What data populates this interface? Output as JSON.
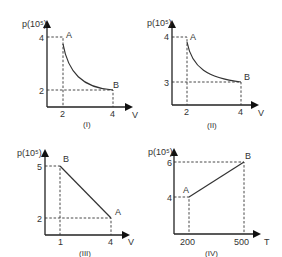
{
  "graphs": [
    {
      "id": "I",
      "caption": "(I)",
      "ylabel": "p(10⁵)",
      "xlabel": "V",
      "y_ticks": [
        "4",
        "2"
      ],
      "x_ticks": [
        "2",
        "4"
      ],
      "points": {
        "A": {
          "label": "A",
          "V": 2,
          "p": 4
        },
        "B": {
          "label": "B",
          "V": 4,
          "p": 2
        }
      },
      "curve": "hyperbola"
    },
    {
      "id": "II",
      "caption": "(II)",
      "ylabel": "p(10⁵)",
      "xlabel": "V",
      "y_ticks": [
        "4",
        "3"
      ],
      "x_ticks": [
        "2",
        "4"
      ],
      "points": {
        "A": {
          "label": "A",
          "V": 2,
          "p": 4
        },
        "B": {
          "label": "B",
          "V": 4,
          "p": 3
        }
      },
      "curve": "curve"
    },
    {
      "id": "III",
      "caption": "(III)",
      "ylabel": "p(10⁵)",
      "xlabel": "V",
      "y_ticks": [
        "5",
        "2"
      ],
      "x_ticks": [
        "1",
        "4"
      ],
      "points": {
        "B": {
          "label": "B",
          "V": 1,
          "p": 5
        },
        "A": {
          "label": "A",
          "V": 4,
          "p": 2
        }
      },
      "curve": "line"
    },
    {
      "id": "IV",
      "caption": "(IV)",
      "ylabel": "p(10⁵)",
      "xlabel": "T",
      "y_ticks": [
        "6",
        "4"
      ],
      "x_ticks": [
        "200",
        "500"
      ],
      "points": {
        "A": {
          "label": "A",
          "T": 200,
          "p": 4
        },
        "B": {
          "label": "B",
          "T": 500,
          "p": 6
        }
      },
      "curve": "line"
    }
  ]
}
